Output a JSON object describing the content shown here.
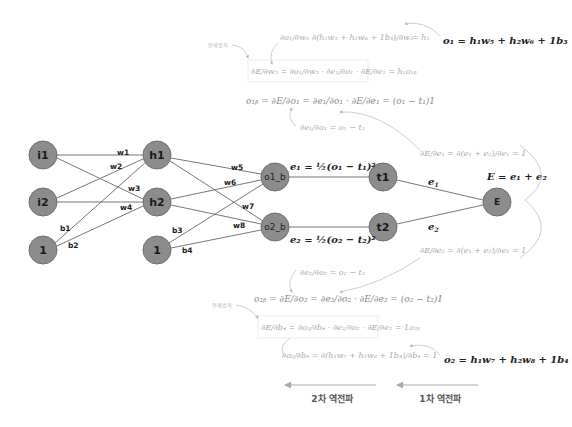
{
  "network": {
    "input_nodes": [
      {
        "id": "i1",
        "label": "i1",
        "cx": 43,
        "cy": 155
      },
      {
        "id": "i2",
        "label": "i2",
        "cx": 43,
        "cy": 202
      },
      {
        "id": "bias1",
        "label": "1",
        "cx": 43,
        "cy": 250
      }
    ],
    "hidden_nodes": [
      {
        "id": "h1",
        "label": "h1",
        "cx": 157,
        "cy": 155
      },
      {
        "id": "h2",
        "label": "h2",
        "cx": 157,
        "cy": 202
      },
      {
        "id": "bias2",
        "label": "1",
        "cx": 157,
        "cy": 250
      }
    ],
    "output_nodes": [
      {
        "id": "o1_b",
        "label": "o1_b",
        "cx": 275,
        "cy": 177
      },
      {
        "id": "o2_b",
        "label": "o2_b",
        "cx": 275,
        "cy": 227
      }
    ],
    "target_nodes": [
      {
        "id": "t1",
        "label": "t1",
        "cx": 383,
        "cy": 177
      },
      {
        "id": "t2",
        "label": "t2",
        "cx": 383,
        "cy": 227
      }
    ],
    "error_node": {
      "id": "E",
      "label": "E",
      "cx": 497,
      "cy": 202
    },
    "weights": [
      "w1",
      "w2",
      "w3",
      "w4",
      "w5",
      "w6",
      "w7",
      "w8"
    ],
    "biases": [
      "b1",
      "b2",
      "b3",
      "b4"
    ],
    "edge_labels": {
      "e1": "e",
      "e1_sub": "1",
      "e2": "e",
      "e2_sub": "2"
    }
  },
  "equations": {
    "o1_def": "o₁ = h₁w₅ + h₂w₆ + 1b₃",
    "o2_def": "o₂ = h₁w₇ + h₂w₈ + 1b₄",
    "e1_def": "e₁ = ½(o₁ − t₁)²",
    "e2_def": "e₂ = ½(o₂ − t₂)²",
    "E_def": "E = e₁ + e₂",
    "do1_dw5_lhs": "∂o₁/∂w₅",
    "do1_dw5_mid": "∂(h₁w₅ + h₂w₆ + 1b₃)/∂w₅",
    "do1_dw5_rhs": "= h₁",
    "dE_dw5": "∂E/∂w₅ = ∂o₁/∂w₅ · ∂e₁/∂o₁ · ∂E/∂e₁ = h₁o₁ᵦ",
    "o1b": "o₁ᵦ = ∂E/∂o₁ = ∂e₁/∂o₁ · ∂E/∂e₁ = (o₁ − t₁)1",
    "de1_do1": "∂e₁/∂o₁ = o₁ − t₁",
    "dE_de1": "∂E/∂e₁ = ∂(e₁ + e₂)/∂e₁ = 1",
    "dE_de2": "∂E/∂e₂ = ∂(e₁ + e₂)/∂e₂ = 1",
    "de2_do2": "∂e₂/∂o₂ = o₂ − t₂",
    "o2b": "o₂ᵦ = ∂E/∂o₂ = ∂e₂/∂o₂ · ∂E/∂e₂ = (o₂ − t₂)1",
    "dE_db4": "∂E/∂b₄ = ∂o₂/∂b₄ · ∂e₂/∂o₂ · ∂E/∂e₂ = 1o₂ᵦ",
    "do2_db4": "∂o₂/∂b₄ = ∂(h₁w₇ + h₂w₈ + 1b₄)/∂b₄ = 1"
  },
  "notes": {
    "chain_rule_top": "연쇄법칙",
    "chain_rule_bottom": "연쇄법칙"
  },
  "backprop": {
    "second": "2차 역전파",
    "first": "1차 역전파"
  },
  "colors": {
    "node_fill": "#8c8c8c",
    "edge": "#777777",
    "formula_light": "#aaaaaa"
  }
}
